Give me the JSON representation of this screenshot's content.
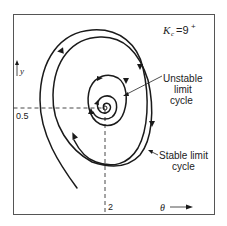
{
  "figure": {
    "parameter_label": "K",
    "parameter_subscript": "c",
    "parameter_value": "=9",
    "parameter_superscript": "+",
    "y_axis_label": "y",
    "x_axis_label": "θ",
    "y_tick": "0.5",
    "x_tick": "2",
    "annotations": {
      "unstable_line1": "Unstable",
      "unstable_line2": "limit",
      "unstable_line3": "cycle",
      "stable_line1": "Stable limit",
      "stable_line2": "cycle"
    },
    "equilibrium": {
      "theta": 2,
      "y": 0.5
    }
  }
}
